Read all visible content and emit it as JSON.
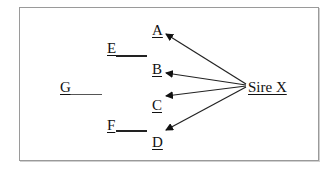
{
  "diagram": {
    "type": "pedigree-arrow-diagram",
    "nodes": {
      "A": {
        "label": "A"
      },
      "B": {
        "label": "B"
      },
      "C": {
        "label": "C"
      },
      "D": {
        "label": "D"
      },
      "E": {
        "label": "E"
      },
      "F": {
        "label": "F"
      },
      "G": {
        "label": "G"
      },
      "sire": {
        "label": "Sire X"
      }
    },
    "edges": [
      {
        "from": "Sire X",
        "to": "A",
        "arrow": true
      },
      {
        "from": "Sire X",
        "to": "B",
        "arrow": true
      },
      {
        "from": "Sire X",
        "to": "C",
        "arrow": true
      },
      {
        "from": "Sire X",
        "to": "D",
        "arrow": true
      }
    ],
    "colors": {
      "line": "#222222",
      "border": "#9a9a9a",
      "background": "#ffffff"
    }
  }
}
